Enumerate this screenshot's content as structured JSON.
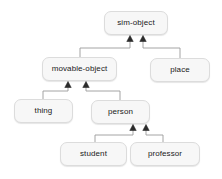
{
  "diagram": {
    "type": "class-inheritance-hierarchy",
    "title": "",
    "background_color": "#ffffff",
    "node_fill_color": "#f7f7f7",
    "node_border_color": "#dcdcdc",
    "edge_color": "#999999",
    "text_color": "#1a1a1a",
    "nodes": [
      {
        "id": "sim-object",
        "label": "sim-object",
        "x": 104,
        "y": 11,
        "w": 64,
        "h": 24
      },
      {
        "id": "movable-object",
        "label": "movable-object",
        "x": 42,
        "y": 57,
        "w": 75,
        "h": 24
      },
      {
        "id": "place",
        "label": "place",
        "x": 150,
        "y": 58,
        "w": 60,
        "h": 24
      },
      {
        "id": "thing",
        "label": "thing",
        "x": 14,
        "y": 99,
        "w": 59,
        "h": 24
      },
      {
        "id": "person",
        "label": "person",
        "x": 91,
        "y": 100,
        "w": 59,
        "h": 24
      },
      {
        "id": "student",
        "label": "student",
        "x": 60,
        "y": 142,
        "w": 67,
        "h": 24
      },
      {
        "id": "professor",
        "label": "professor",
        "x": 130,
        "y": 142,
        "w": 70,
        "h": 24
      }
    ],
    "edges": [
      {
        "from": "movable-object",
        "to": "sim-object",
        "arrow": "hollow-triangle-up"
      },
      {
        "from": "place",
        "to": "sim-object",
        "arrow": "hollow-triangle-up"
      },
      {
        "from": "thing",
        "to": "movable-object",
        "arrow": "hollow-triangle-up"
      },
      {
        "from": "person",
        "to": "movable-object",
        "arrow": "hollow-triangle-up"
      },
      {
        "from": "student",
        "to": "person",
        "arrow": "hollow-triangle-up"
      },
      {
        "from": "professor",
        "to": "person",
        "arrow": "hollow-triangle-up"
      }
    ]
  }
}
